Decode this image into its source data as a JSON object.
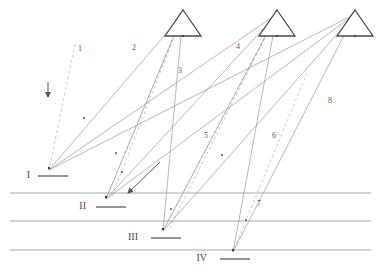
{
  "figure": {
    "type": "survey-triangulation-diagram",
    "background_color": "#ffffff",
    "width": 381,
    "height": 275
  },
  "colors": {
    "solid_ray": "#9b9b9b",
    "dashed_ray": "#bdbdbd",
    "horizontal_line": "#a8a8a8",
    "triangle_stroke": "#4a4a4a",
    "marker_bar": "#7a7a7a",
    "arrow": "#555555",
    "point": "#3a3a3a",
    "label_text": "#5a5a5a",
    "roman_text": "#4a4a4a"
  },
  "stations": [
    {
      "id": "tri-1",
      "label": "",
      "apex_x": 183,
      "apex_y": 10,
      "base_y": 36,
      "half_width": 18
    },
    {
      "id": "tri-2",
      "label": "",
      "apex_x": 277,
      "apex_y": 10,
      "base_y": 36,
      "half_width": 18
    },
    {
      "id": "tri-3",
      "label": "",
      "apex_x": 355,
      "apex_y": 10,
      "base_y": 36,
      "half_width": 18
    }
  ],
  "ground_markers": [
    {
      "id": "marker-1",
      "label": "I",
      "x": 30,
      "y": 176,
      "bar_x1": 38,
      "bar_x2": 68,
      "node_x": 49,
      "node_y": 168
    },
    {
      "id": "marker-2",
      "label": "II",
      "x": 86,
      "y": 207,
      "bar_x1": 96,
      "bar_x2": 126,
      "node_x": 106,
      "node_y": 197
    },
    {
      "id": "marker-3",
      "label": "III",
      "x": 138,
      "y": 238,
      "bar_x1": 151,
      "bar_x2": 181,
      "node_x": 163,
      "node_y": 229
    },
    {
      "id": "marker-4",
      "label": "IV",
      "x": 207,
      "y": 259,
      "bar_x1": 220,
      "bar_x2": 250,
      "node_x": 233,
      "node_y": 250
    }
  ],
  "ray_labels": [
    {
      "id": "ray-label-1",
      "text": "1",
      "x": 80,
      "y": 51
    },
    {
      "id": "ray-label-2",
      "text": "2",
      "x": 134,
      "y": 50
    },
    {
      "id": "ray-label-3",
      "text": "3",
      "x": 180,
      "y": 73
    },
    {
      "id": "ray-label-4",
      "text": "4",
      "x": 238,
      "y": 49
    },
    {
      "id": "ray-label-5",
      "text": "5",
      "x": 206,
      "y": 138
    },
    {
      "id": "ray-label-6",
      "text": "6",
      "x": 274,
      "y": 138
    },
    {
      "id": "ray-label-7",
      "text": "7",
      "x": 259,
      "y": 206
    },
    {
      "id": "ray-label-8",
      "text": "8",
      "x": 330,
      "y": 103
    }
  ],
  "horizontal_lines": [
    {
      "id": "h-line-1",
      "y": 193,
      "x1": 10,
      "x2": 371
    },
    {
      "id": "h-line-2",
      "y": 221,
      "x1": 10,
      "x2": 371
    },
    {
      "id": "h-line-3",
      "y": 250,
      "x1": 10,
      "x2": 371
    }
  ],
  "solid_rays": [
    {
      "id": "solid-ray-a",
      "x1": 183,
      "y1": 14,
      "x2": 49,
      "y2": 170
    },
    {
      "id": "solid-ray-b",
      "x1": 183,
      "y1": 14,
      "x2": 106,
      "y2": 199
    },
    {
      "id": "solid-ray-c",
      "x1": 183,
      "y1": 14,
      "x2": 163,
      "y2": 231
    },
    {
      "id": "solid-ray-d",
      "x1": 277,
      "y1": 14,
      "x2": 49,
      "y2": 170
    },
    {
      "id": "solid-ray-e",
      "x1": 277,
      "y1": 14,
      "x2": 106,
      "y2": 199
    },
    {
      "id": "solid-ray-f",
      "x1": 277,
      "y1": 14,
      "x2": 163,
      "y2": 231
    },
    {
      "id": "solid-ray-g",
      "x1": 277,
      "y1": 14,
      "x2": 233,
      "y2": 252
    },
    {
      "id": "solid-ray-h",
      "x1": 355,
      "y1": 14,
      "x2": 49,
      "y2": 170
    },
    {
      "id": "solid-ray-i",
      "x1": 355,
      "y1": 14,
      "x2": 106,
      "y2": 199
    },
    {
      "id": "solid-ray-j",
      "x1": 355,
      "y1": 14,
      "x2": 163,
      "y2": 231
    },
    {
      "id": "solid-ray-k",
      "x1": 355,
      "y1": 14,
      "x2": 233,
      "y2": 252
    }
  ],
  "dashed_rays": [
    {
      "id": "dashed-ray-a",
      "x1": 75,
      "y1": 44,
      "x2": 49,
      "y2": 170
    },
    {
      "id": "dashed-ray-b",
      "x1": 183,
      "y1": 14,
      "x2": 106,
      "y2": 199
    },
    {
      "id": "dashed-ray-c",
      "x1": 183,
      "y1": 14,
      "x2": 112,
      "y2": 196
    },
    {
      "id": "dashed-ray-d",
      "x1": 277,
      "y1": 14,
      "x2": 163,
      "y2": 231
    },
    {
      "id": "dashed-ray-e",
      "x1": 277,
      "y1": 14,
      "x2": 169,
      "y2": 229
    },
    {
      "id": "dashed-ray-f",
      "x1": 307,
      "y1": 73,
      "x2": 233,
      "y2": 252
    }
  ],
  "arrows": [
    {
      "id": "arrow-down",
      "x1": 48,
      "y1": 82,
      "x2": 48,
      "y2": 97,
      "direction": "down"
    },
    {
      "id": "arrow-diagonal",
      "x1": 160,
      "y1": 162,
      "x2": 128,
      "y2": 193,
      "direction": "down-left"
    }
  ],
  "points": [
    {
      "id": "point-1",
      "x": 84,
      "y": 118
    },
    {
      "id": "point-2",
      "x": 116,
      "y": 153
    },
    {
      "id": "point-3",
      "x": 122,
      "y": 172
    },
    {
      "id": "point-4",
      "x": 171,
      "y": 209
    },
    {
      "id": "point-5",
      "x": 222,
      "y": 155
    },
    {
      "id": "point-6",
      "x": 246,
      "y": 220
    }
  ]
}
